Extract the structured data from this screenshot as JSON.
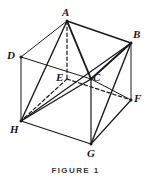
{
  "figure": {
    "caption": "FIGURE 1",
    "stroke_color": "#1a1a1a",
    "background_color": "#ffffff",
    "canvas": {
      "width": 151,
      "height": 183
    },
    "vertices": [
      {
        "id": "A",
        "label": "A",
        "x": 67,
        "y": 21,
        "label_x": 62,
        "label_y": 7,
        "hidden": false
      },
      {
        "id": "B",
        "label": "B",
        "x": 131,
        "y": 43,
        "label_x": 133,
        "label_y": 29,
        "hidden": false
      },
      {
        "id": "C",
        "label": "C",
        "x": 91,
        "y": 79,
        "label_x": 93,
        "label_y": 72,
        "hidden": false
      },
      {
        "id": "D",
        "label": "D",
        "x": 21,
        "y": 57,
        "label_x": 7,
        "label_y": 50,
        "hidden": false
      },
      {
        "id": "E",
        "label": "E",
        "x": 67,
        "y": 79,
        "label_x": 56,
        "label_y": 72,
        "hidden": true
      },
      {
        "id": "F",
        "label": "F",
        "x": 131,
        "y": 100,
        "label_x": 134,
        "label_y": 93,
        "hidden": false
      },
      {
        "id": "G",
        "label": "G",
        "x": 91,
        "y": 144,
        "label_x": 87,
        "label_y": 148,
        "hidden": false
      },
      {
        "id": "H",
        "label": "H",
        "x": 21,
        "y": 121,
        "label_x": 10,
        "label_y": 124,
        "hidden": false
      }
    ],
    "edges": [
      {
        "from": "A",
        "to": "B",
        "style": "solid",
        "weight": 1.6
      },
      {
        "from": "A",
        "to": "D",
        "style": "solid",
        "weight": 1.0
      },
      {
        "from": "A",
        "to": "C",
        "style": "solid",
        "weight": 1.9
      },
      {
        "from": "A",
        "to": "H",
        "style": "solid",
        "weight": 1.4
      },
      {
        "from": "A",
        "to": "E",
        "style": "dashed",
        "weight": 1.2
      },
      {
        "from": "D",
        "to": "C",
        "style": "solid",
        "weight": 1.0
      },
      {
        "from": "D",
        "to": "H",
        "style": "solid",
        "weight": 1.0
      },
      {
        "from": "B",
        "to": "C",
        "style": "solid",
        "weight": 1.9
      },
      {
        "from": "B",
        "to": "F",
        "style": "solid",
        "weight": 1.0
      },
      {
        "from": "B",
        "to": "G",
        "style": "solid",
        "weight": 1.4
      },
      {
        "from": "B",
        "to": "H",
        "style": "solid",
        "weight": 1.2
      },
      {
        "from": "C",
        "to": "G",
        "style": "solid",
        "weight": 1.2
      },
      {
        "from": "C",
        "to": "H",
        "style": "solid",
        "weight": 1.4
      },
      {
        "from": "C",
        "to": "F",
        "style": "solid",
        "weight": 1.0
      },
      {
        "from": "E",
        "to": "H",
        "style": "dashed",
        "weight": 1.2
      },
      {
        "from": "E",
        "to": "F",
        "style": "dashed",
        "weight": 1.2
      },
      {
        "from": "H",
        "to": "G",
        "style": "solid",
        "weight": 1.3
      },
      {
        "from": "G",
        "to": "F",
        "style": "solid",
        "weight": 1.2
      }
    ]
  }
}
